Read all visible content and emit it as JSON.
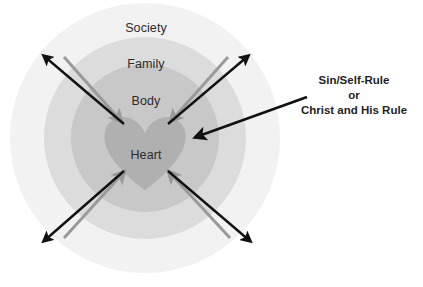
{
  "diagram": {
    "rings": [
      {
        "name": "society",
        "label": "Society",
        "color": "#f2f2f2",
        "label_x": 146,
        "label_y": 21
      },
      {
        "name": "family",
        "label": "Family",
        "color": "#dcdcdc",
        "label_x": 146,
        "label_y": 57
      },
      {
        "name": "body",
        "label": "Body",
        "color": "#c8c8c8",
        "label_x": 146,
        "label_y": 94
      },
      {
        "name": "heart",
        "label": "Heart",
        "color": "#b0b0b0",
        "label_x": 146,
        "label_y": 148
      }
    ],
    "annotation": {
      "lines": [
        "Sin/Self-Rule",
        "or",
        "Christ and His Rule"
      ],
      "pointer_from_x": 307,
      "pointer_from_y": 97,
      "pointer_to_x": 196,
      "pointer_to_y": 137
    },
    "arrows": {
      "outward_color": "#111111",
      "inward_color": "#9a9a9a",
      "outward_count": 4,
      "inward_count": 4,
      "directions": [
        "up-left",
        "up-right",
        "down-left",
        "down-right"
      ]
    },
    "geometry": {
      "center_x": 145,
      "center_y": 138,
      "outer_radius": 135,
      "ring2_radius": 101,
      "ring3_radius": 74,
      "heart_half_width": 44
    },
    "background_color": "#ffffff"
  }
}
